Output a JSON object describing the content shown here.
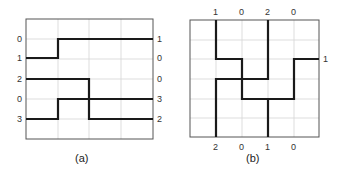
{
  "panels": [
    {
      "id": "a",
      "caption": "(a)",
      "left_labels": [
        "0",
        "1",
        "2",
        "0",
        "3"
      ],
      "right_labels": [
        "1",
        "0",
        "0",
        "3",
        "2"
      ]
    },
    {
      "id": "b",
      "caption": "(b)",
      "top_labels": [
        "1",
        "0",
        "2",
        "0"
      ],
      "bottom_labels": [
        "2",
        "0",
        "1",
        "0"
      ],
      "right_labels": [
        "1"
      ]
    }
  ]
}
